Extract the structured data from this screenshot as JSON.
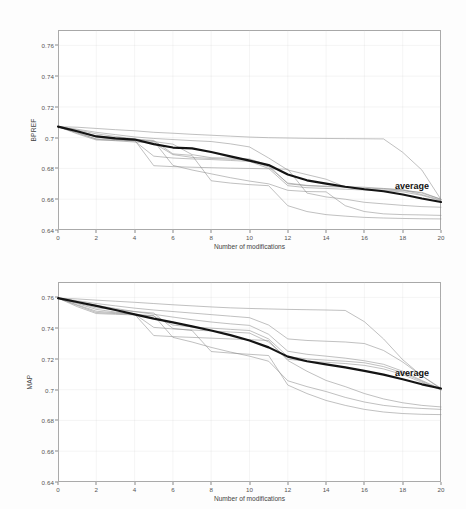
{
  "figure": {
    "background": "#fdfdfd",
    "grid_color": "#c9c9c9",
    "axis_color": "#a8a8a8",
    "series_color": "#8c8c8c",
    "average_color": "#141414"
  },
  "chart_data": [
    {
      "type": "line",
      "panel": "top",
      "title": "",
      "xlabel": "Number of modifications",
      "ylabel": "BPREF",
      "xlim": [
        0,
        20
      ],
      "ylim": [
        0.64,
        0.77
      ],
      "grid": true,
      "legend_position": "inline-annotation",
      "xticks": [
        0,
        2,
        4,
        6,
        8,
        10,
        12,
        14,
        16,
        18,
        20
      ],
      "xticklabels": [
        "0",
        "2",
        "4",
        "6",
        "8",
        "10",
        "12",
        "14",
        "16",
        "18",
        "20"
      ],
      "yticks": [
        0.64,
        0.66,
        0.68,
        0.7,
        0.72,
        0.74,
        0.76
      ],
      "yticklabels": [
        "0.64",
        "0.66",
        "0.68",
        "0.7",
        "0.72",
        "0.74",
        "0.76"
      ],
      "annotations": [
        {
          "text": "average",
          "x": 17.6,
          "y": 0.6655
        }
      ],
      "x": [
        0,
        1,
        2,
        3,
        4,
        5,
        6,
        7,
        8,
        9,
        10,
        11,
        12,
        13,
        14,
        15,
        16,
        17,
        18,
        19,
        20
      ],
      "series": [
        {
          "name": "average",
          "emphasis": true,
          "values": [
            0.7072,
            0.7042,
            0.7008,
            0.6995,
            0.6988,
            0.6958,
            0.6936,
            0.6931,
            0.6907,
            0.6879,
            0.6851,
            0.6822,
            0.6761,
            0.6723,
            0.6701,
            0.6681,
            0.6665,
            0.6652,
            0.6631,
            0.6605,
            0.6582
          ]
        },
        {
          "name": "run-1",
          "emphasis": false,
          "values": [
            0.7072,
            0.7068,
            0.706,
            0.7052,
            0.7045,
            0.7035,
            0.7029,
            0.7022,
            0.7016,
            0.701,
            0.7004,
            0.7,
            0.6998,
            0.6996,
            0.6995,
            0.6994,
            0.6993,
            0.6992,
            0.6905,
            0.679,
            0.6598
          ]
        },
        {
          "name": "run-2",
          "emphasis": false,
          "values": [
            0.7072,
            0.7055,
            0.7035,
            0.702,
            0.7005,
            0.6995,
            0.6988,
            0.6981,
            0.6975,
            0.696,
            0.694,
            0.6868,
            0.679,
            0.676,
            0.673,
            0.668,
            0.6665,
            0.666,
            0.6655,
            0.6645,
            0.66
          ]
        },
        {
          "name": "run-3",
          "emphasis": false,
          "values": [
            0.7072,
            0.705,
            0.7025,
            0.7008,
            0.6992,
            0.6975,
            0.6958,
            0.689,
            0.687,
            0.6868,
            0.6862,
            0.682,
            0.67,
            0.6688,
            0.6682,
            0.6678,
            0.6672,
            0.6668,
            0.6662,
            0.664,
            0.66
          ]
        },
        {
          "name": "run-4",
          "emphasis": false,
          "values": [
            0.7072,
            0.7035,
            0.699,
            0.698,
            0.6972,
            0.6965,
            0.689,
            0.6872,
            0.6865,
            0.686,
            0.6855,
            0.681,
            0.6705,
            0.669,
            0.6685,
            0.6682,
            0.6678,
            0.667,
            0.666,
            0.663,
            0.6595
          ]
        },
        {
          "name": "run-5",
          "emphasis": false,
          "values": [
            0.7072,
            0.704,
            0.7005,
            0.699,
            0.6978,
            0.688,
            0.6868,
            0.6862,
            0.6858,
            0.6852,
            0.6846,
            0.68,
            0.6688,
            0.6675,
            0.667,
            0.6665,
            0.666,
            0.6655,
            0.6648,
            0.6625,
            0.659
          ]
        },
        {
          "name": "run-6",
          "emphasis": false,
          "values": [
            0.7072,
            0.703,
            0.6992,
            0.6988,
            0.6985,
            0.6818,
            0.6812,
            0.6808,
            0.6805,
            0.6802,
            0.68,
            0.6798,
            0.6795,
            0.664,
            0.6615,
            0.66,
            0.658,
            0.657,
            0.656,
            0.6552,
            0.6548
          ]
        },
        {
          "name": "run-7",
          "emphasis": false,
          "values": [
            0.7072,
            0.7025,
            0.6985,
            0.6982,
            0.698,
            0.6978,
            0.682,
            0.679,
            0.6765,
            0.674,
            0.6718,
            0.67,
            0.6658,
            0.665,
            0.6648,
            0.6558,
            0.652,
            0.6505,
            0.65,
            0.6498,
            0.6495
          ]
        },
        {
          "name": "run-8",
          "emphasis": false,
          "values": [
            0.7072,
            0.7045,
            0.7012,
            0.7,
            0.699,
            0.6982,
            0.6895,
            0.6885,
            0.672,
            0.6705,
            0.6695,
            0.6688,
            0.6558,
            0.652,
            0.65,
            0.649,
            0.6482,
            0.6478,
            0.6475,
            0.6473,
            0.6472
          ]
        }
      ]
    },
    {
      "type": "line",
      "panel": "bottom",
      "title": "",
      "xlabel": "Number of modifications",
      "ylabel": "MAP",
      "xlim": [
        0,
        20
      ],
      "ylim": [
        0.64,
        0.77
      ],
      "grid": true,
      "legend_position": "inline-annotation",
      "xticks": [
        0,
        2,
        4,
        6,
        8,
        10,
        12,
        14,
        16,
        18,
        20
      ],
      "xticklabels": [
        "0",
        "2",
        "4",
        "6",
        "8",
        "10",
        "12",
        "14",
        "16",
        "18",
        "20"
      ],
      "yticks": [
        0.64,
        0.66,
        0.68,
        0.7,
        0.72,
        0.74,
        0.76
      ],
      "yticklabels": [
        "0.64",
        "0.66",
        "0.68",
        "0.7",
        "0.72",
        "0.74",
        "0.76"
      ],
      "annotations": [
        {
          "text": "average",
          "x": 17.6,
          "y": 0.7075
        }
      ],
      "x": [
        0,
        1,
        2,
        3,
        4,
        5,
        6,
        7,
        8,
        9,
        10,
        11,
        12,
        13,
        14,
        15,
        16,
        17,
        18,
        19,
        20
      ],
      "series": [
        {
          "name": "average",
          "emphasis": true,
          "values": [
            0.7595,
            0.757,
            0.7545,
            0.7518,
            0.749,
            0.7462,
            0.7438,
            0.7412,
            0.7385,
            0.7355,
            0.732,
            0.7275,
            0.7215,
            0.7185,
            0.7165,
            0.7145,
            0.7122,
            0.7098,
            0.7068,
            0.7035,
            0.7008
          ]
        },
        {
          "name": "run-1",
          "emphasis": false,
          "values": [
            0.7595,
            0.759,
            0.7582,
            0.7575,
            0.7568,
            0.756,
            0.7552,
            0.7545,
            0.7538,
            0.7532,
            0.7528,
            0.7525,
            0.7522,
            0.752,
            0.7518,
            0.7515,
            0.7442,
            0.733,
            0.7195,
            0.709,
            0.7005
          ]
        },
        {
          "name": "run-2",
          "emphasis": false,
          "values": [
            0.7595,
            0.7578,
            0.756,
            0.7545,
            0.753,
            0.7518,
            0.7508,
            0.7498,
            0.7488,
            0.7478,
            0.7468,
            0.742,
            0.733,
            0.732,
            0.7315,
            0.731,
            0.73,
            0.7255,
            0.718,
            0.709,
            0.701
          ]
        },
        {
          "name": "run-3",
          "emphasis": false,
          "values": [
            0.7595,
            0.7572,
            0.7548,
            0.7528,
            0.7508,
            0.749,
            0.7472,
            0.7455,
            0.744,
            0.7428,
            0.7418,
            0.736,
            0.725,
            0.723,
            0.7218,
            0.7205,
            0.7188,
            0.7165,
            0.712,
            0.706,
            0.7005
          ]
        },
        {
          "name": "run-4",
          "emphasis": false,
          "values": [
            0.7595,
            0.756,
            0.7522,
            0.7505,
            0.749,
            0.7478,
            0.742,
            0.7408,
            0.74,
            0.7392,
            0.7385,
            0.733,
            0.7215,
            0.72,
            0.7192,
            0.7185,
            0.7175,
            0.715,
            0.711,
            0.7055,
            0.7
          ]
        },
        {
          "name": "run-5",
          "emphasis": false,
          "values": [
            0.7595,
            0.7552,
            0.751,
            0.75,
            0.7492,
            0.7405,
            0.7395,
            0.7388,
            0.7382,
            0.7375,
            0.7368,
            0.731,
            0.7198,
            0.7185,
            0.7178,
            0.717,
            0.7158,
            0.7135,
            0.7098,
            0.7048,
            0.6998
          ]
        },
        {
          "name": "run-6",
          "emphasis": false,
          "values": [
            0.7595,
            0.7548,
            0.7502,
            0.7495,
            0.749,
            0.7352,
            0.7345,
            0.734,
            0.7335,
            0.733,
            0.7325,
            0.732,
            0.719,
            0.712,
            0.706,
            0.702,
            0.6975,
            0.694,
            0.6915,
            0.6898,
            0.6888
          ]
        },
        {
          "name": "run-7",
          "emphasis": false,
          "values": [
            0.7595,
            0.754,
            0.7495,
            0.749,
            0.7486,
            0.7482,
            0.734,
            0.731,
            0.7275,
            0.7245,
            0.7218,
            0.7185,
            0.7058,
            0.702,
            0.6988,
            0.695,
            0.692,
            0.6898,
            0.6885,
            0.6878,
            0.6872
          ]
        },
        {
          "name": "run-8",
          "emphasis": false,
          "values": [
            0.7595,
            0.7565,
            0.7532,
            0.752,
            0.7508,
            0.7498,
            0.7398,
            0.7385,
            0.7248,
            0.7238,
            0.723,
            0.7222,
            0.703,
            0.6975,
            0.693,
            0.6898,
            0.6872,
            0.6855,
            0.6845,
            0.684,
            0.6838
          ]
        }
      ]
    }
  ]
}
